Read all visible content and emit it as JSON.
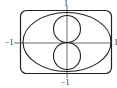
{
  "diagram": {
    "type": "curves-on-axes",
    "labels": {
      "top": "1",
      "bottom": "−1",
      "left": "−1",
      "right": "1"
    },
    "shapes": [
      {
        "name": "rounded-rectangle",
        "description": "superellipse-like outer curve"
      },
      {
        "name": "ellipse",
        "description": "horizontal ellipse through (±1,0) and (0,±1)"
      },
      {
        "name": "upper-circle",
        "description": "circle tangent at origin, upper half"
      },
      {
        "name": "lower-circle",
        "description": "circle tangent at origin, lower half"
      }
    ],
    "colors": {
      "stroke": "#222222",
      "axis": "#444444",
      "background": "#ffffff"
    }
  }
}
